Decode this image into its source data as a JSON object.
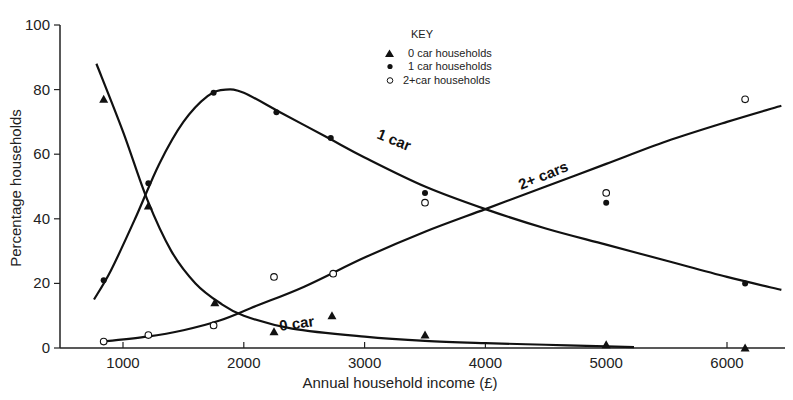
{
  "chart_data": {
    "type": "scatter",
    "title": "",
    "xlabel": "Annual household income (£)",
    "ylabel": "Percentage households",
    "xlim": [
      550,
      6500
    ],
    "ylim": [
      0,
      100
    ],
    "x_ticks": [
      1000,
      2000,
      3000,
      4000,
      5000,
      6000
    ],
    "y_ticks": [
      0,
      20,
      40,
      60,
      80,
      100
    ],
    "grid": false,
    "legend": {
      "title": "KEY",
      "position": "top-center",
      "entries": [
        {
          "marker": "filled-triangle",
          "label": "0 car households"
        },
        {
          "marker": "filled-circle",
          "label": "1 car households"
        },
        {
          "marker": "open-circle",
          "label": "2+car households"
        }
      ]
    },
    "series": [
      {
        "name": "0 car households",
        "marker": "filled-triangle",
        "curve_label": "0 car",
        "x": [
          840,
          1210,
          1760,
          2250,
          2730,
          3500,
          5000,
          6150
        ],
        "values": [
          77,
          44,
          14,
          5,
          10,
          4,
          1,
          0
        ],
        "fit_curve": [
          [
            780,
            88
          ],
          [
            1000,
            67
          ],
          [
            1200,
            46
          ],
          [
            1400,
            30
          ],
          [
            1600,
            20
          ],
          [
            1800,
            14
          ],
          [
            2000,
            10
          ],
          [
            2400,
            6
          ],
          [
            3000,
            3.5
          ],
          [
            3500,
            2.2
          ],
          [
            4000,
            1.5
          ],
          [
            4500,
            1
          ],
          [
            5000,
            0.5
          ],
          [
            5230,
            0.3
          ]
        ]
      },
      {
        "name": "1 car households",
        "marker": "filled-circle",
        "curve_label": "1 car",
        "x": [
          840,
          1210,
          1750,
          2270,
          2720,
          3500,
          5000,
          6150
        ],
        "values": [
          21,
          51,
          79,
          73,
          65,
          48,
          45,
          20
        ],
        "fit_curve": [
          [
            760,
            15
          ],
          [
            900,
            24
          ],
          [
            1100,
            40
          ],
          [
            1300,
            57
          ],
          [
            1500,
            70
          ],
          [
            1700,
            78
          ],
          [
            1850,
            80
          ],
          [
            2000,
            79
          ],
          [
            2300,
            73
          ],
          [
            2700,
            65
          ],
          [
            3000,
            59
          ],
          [
            3500,
            50
          ],
          [
            4000,
            43
          ],
          [
            4500,
            37
          ],
          [
            5000,
            32
          ],
          [
            5500,
            27
          ],
          [
            6000,
            22
          ],
          [
            6450,
            18
          ]
        ]
      },
      {
        "name": "2+car households",
        "marker": "open-circle",
        "curve_label": "2+ cars",
        "x": [
          840,
          1210,
          1750,
          2250,
          2740,
          3500,
          5000,
          6150
        ],
        "values": [
          2,
          4,
          7,
          22,
          23,
          45,
          48,
          77
        ],
        "fit_curve": [
          [
            840,
            2
          ],
          [
            1200,
            3.5
          ],
          [
            1500,
            5.5
          ],
          [
            1800,
            8.5
          ],
          [
            2100,
            13
          ],
          [
            2500,
            19
          ],
          [
            3000,
            28
          ],
          [
            3500,
            36
          ],
          [
            4000,
            43
          ],
          [
            4500,
            50
          ],
          [
            5000,
            57
          ],
          [
            5500,
            64
          ],
          [
            6000,
            70
          ],
          [
            6450,
            75
          ]
        ]
      }
    ]
  }
}
